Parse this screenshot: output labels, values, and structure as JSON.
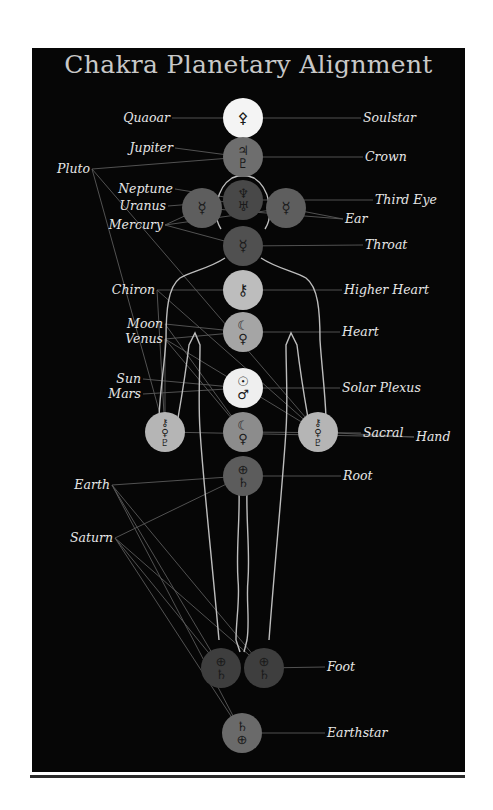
{
  "title": "Chakra Planetary Alignment",
  "colors": {
    "background": "#060606",
    "title": "#c8c8c8",
    "label": "#e6e6e6",
    "connector": "#5a5a5a",
    "body_outline": "#bdbdbd"
  },
  "chakras": [
    {
      "name": "Soulstar",
      "x": 243,
      "y": 118,
      "fill": "#f4f4f4",
      "symbols": [
        "⚴"
      ],
      "planets": [
        "Quaoar"
      ]
    },
    {
      "name": "Crown",
      "x": 243,
      "y": 157,
      "fill": "#6e6e6e",
      "symbols": [
        "♃",
        "♇"
      ],
      "planets": [
        "Jupiter",
        "Pluto"
      ]
    },
    {
      "name": "Third Eye",
      "x": 243,
      "y": 200,
      "fill": "#484848",
      "symbols": [
        "♆",
        "♅"
      ],
      "planets": [
        "Neptune",
        "Uranus"
      ]
    },
    {
      "name": "Ear (left)",
      "x": 202,
      "y": 208,
      "fill": "#5e5e5e",
      "symbols": [
        "☿"
      ],
      "planets": [
        "Mercury"
      ]
    },
    {
      "name": "Ear (right)",
      "x": 286,
      "y": 208,
      "fill": "#5e5e5e",
      "symbols": [
        "☿"
      ],
      "planets": [
        "Mercury"
      ]
    },
    {
      "name": "Throat",
      "x": 243,
      "y": 246,
      "fill": "#505050",
      "symbols": [
        "☿"
      ],
      "planets": [
        "Mercury"
      ]
    },
    {
      "name": "Higher Heart",
      "x": 243,
      "y": 290,
      "fill": "#bdbdbd",
      "symbols": [
        "⚷"
      ],
      "planets": [
        "Chiron"
      ]
    },
    {
      "name": "Heart",
      "x": 243,
      "y": 332,
      "fill": "#a5a5a5",
      "symbols": [
        "☾",
        "♀"
      ],
      "planets": [
        "Moon",
        "Venus"
      ]
    },
    {
      "name": "Solar Plexus",
      "x": 243,
      "y": 388,
      "fill": "#efefef",
      "symbols": [
        "☉",
        "♂"
      ],
      "planets": [
        "Sun",
        "Mars"
      ]
    },
    {
      "name": "Sacral",
      "x": 243,
      "y": 432,
      "fill": "#8c8c8c",
      "symbols": [
        "☾",
        "♀"
      ],
      "planets": [
        "Moon",
        "Venus"
      ]
    },
    {
      "name": "Hand (left)",
      "x": 165,
      "y": 432,
      "fill": "#b5b5b5",
      "symbols": [
        "⚷",
        "♀",
        "♇"
      ],
      "planets": [
        "Chiron",
        "Venus",
        "Pluto"
      ]
    },
    {
      "name": "Hand (right)",
      "x": 318,
      "y": 432,
      "fill": "#b5b5b5",
      "symbols": [
        "⚷",
        "♀",
        "♇"
      ],
      "planets": [
        "Chiron",
        "Venus",
        "Pluto"
      ]
    },
    {
      "name": "Root",
      "x": 243,
      "y": 476,
      "fill": "#5c5c5c",
      "symbols": [
        "⊕",
        "♄"
      ],
      "planets": [
        "Earth",
        "Saturn"
      ]
    },
    {
      "name": "Foot (left)",
      "x": 221,
      "y": 668,
      "fill": "#3e3e3e",
      "symbols": [
        "⊕",
        "♄"
      ],
      "planets": [
        "Earth",
        "Saturn"
      ]
    },
    {
      "name": "Foot (right)",
      "x": 264,
      "y": 668,
      "fill": "#3e3e3e",
      "symbols": [
        "⊕",
        "♄"
      ],
      "planets": [
        "Earth",
        "Saturn"
      ]
    },
    {
      "name": "Earthstar",
      "x": 242,
      "y": 733,
      "fill": "#6a6a6a",
      "symbols": [
        "♄",
        "⊕"
      ],
      "planets": [
        "Saturn",
        "Earth"
      ]
    }
  ],
  "left_labels": [
    {
      "text": "Quaoar",
      "x": 170,
      "y": 122
    },
    {
      "text": "Jupiter",
      "x": 173,
      "y": 152
    },
    {
      "text": "Pluto",
      "x": 90,
      "y": 173
    },
    {
      "text": "Neptune",
      "x": 173,
      "y": 193
    },
    {
      "text": "Uranus",
      "x": 166,
      "y": 210
    },
    {
      "text": "Mercury",
      "x": 163,
      "y": 229
    },
    {
      "text": "Chiron",
      "x": 155,
      "y": 294
    },
    {
      "text": "Moon",
      "x": 163,
      "y": 328
    },
    {
      "text": "Venus",
      "x": 163,
      "y": 343
    },
    {
      "text": "Sun",
      "x": 141,
      "y": 383
    },
    {
      "text": "Mars",
      "x": 141,
      "y": 398
    },
    {
      "text": "Earth",
      "x": 110,
      "y": 489
    },
    {
      "text": "Saturn",
      "x": 113,
      "y": 542
    }
  ],
  "right_labels": [
    {
      "text": "Soulstar",
      "x": 363,
      "y": 122
    },
    {
      "text": "Crown",
      "x": 365,
      "y": 161
    },
    {
      "text": "Third Eye",
      "x": 375,
      "y": 204
    },
    {
      "text": "Ear",
      "x": 345,
      "y": 223
    },
    {
      "text": "Throat",
      "x": 365,
      "y": 249
    },
    {
      "text": "Higher Heart",
      "x": 344,
      "y": 294
    },
    {
      "text": "Heart",
      "x": 342,
      "y": 336
    },
    {
      "text": "Solar Plexus",
      "x": 342,
      "y": 392
    },
    {
      "text": "Sacral",
      "x": 363,
      "y": 437
    },
    {
      "text": "Hand",
      "x": 416,
      "y": 441
    },
    {
      "text": "Root",
      "x": 343,
      "y": 480
    },
    {
      "text": "Foot",
      "x": 327,
      "y": 671
    },
    {
      "text": "Earthstar",
      "x": 327,
      "y": 737
    }
  ]
}
